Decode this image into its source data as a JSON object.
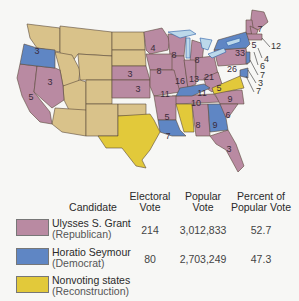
{
  "colors": {
    "republican": "#b98aa2",
    "democrat": "#5f86c4",
    "nonvoting": "#e2c93a",
    "territory": "#d9c28a",
    "water": "#bcd8ea"
  },
  "map": {
    "labels": {
      "OR": "3",
      "CA": "5",
      "NV": "3",
      "NE": "3",
      "KS": "3",
      "MN": "4",
      "WI": "8",
      "IA": "8",
      "MI": "8",
      "IL": "16",
      "IN": "13",
      "OH": "21",
      "MO": "11",
      "KY": "11",
      "WV": "5",
      "PA": "26",
      "NY": "33",
      "ME": "7",
      "NH": "5",
      "TN": "10",
      "NC": "9",
      "SC": "6",
      "AR": "5",
      "LA": "7",
      "AL": "8",
      "GA": "9",
      "FL": "3"
    },
    "callouts": [
      {
        "state": "MA",
        "value": "12"
      },
      {
        "state": "RI",
        "value": "4"
      },
      {
        "state": "CT",
        "value": "6"
      },
      {
        "state": "NJ",
        "value": "7"
      },
      {
        "state": "DE",
        "value": "3"
      },
      {
        "state": "MD",
        "value": "7"
      }
    ]
  },
  "table": {
    "headers": {
      "candidate": "Candidate",
      "electoral_1": "Electoral",
      "electoral_2": "Vote",
      "popular_1": "Popular",
      "popular_2": "Vote",
      "percent_1": "Percent of",
      "percent_2": "Popular Vote"
    },
    "rows": [
      {
        "name": "Ulysses S. Grant",
        "party": "(Republican)",
        "electoral": "214",
        "popular": "3,012,833",
        "percent": "52.7"
      },
      {
        "name": "Horatio Seymour",
        "party": "(Democrat)",
        "electoral": "80",
        "popular": "2,703,249",
        "percent": "47.3"
      },
      {
        "name": "Nonvoting states",
        "party": "(Reconstruction)",
        "electoral": "",
        "popular": "",
        "percent": ""
      }
    ]
  }
}
